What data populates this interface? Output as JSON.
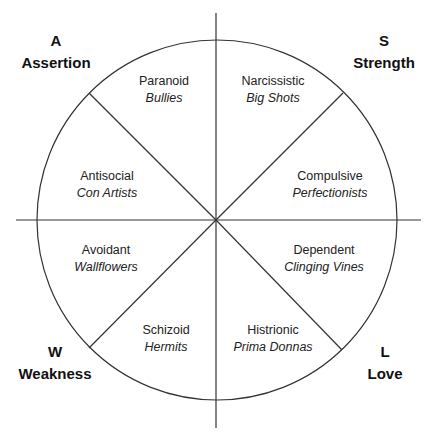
{
  "diagram": {
    "type": "circumplex-wheel",
    "line_color": "#333333",
    "center": [
      216,
      220
    ],
    "radius": 180,
    "corners": [
      {
        "id": "assertion",
        "letter": "A",
        "word": "Assertion",
        "x": 56,
        "y": 30
      },
      {
        "id": "strength",
        "letter": "S",
        "word": "Strength",
        "x": 384,
        "y": 30
      },
      {
        "id": "weakness",
        "letter": "W",
        "word": "Weakness",
        "x": 55,
        "y": 341
      },
      {
        "id": "love",
        "letter": "L",
        "word": "Love",
        "x": 385,
        "y": 341
      }
    ],
    "segments": [
      {
        "id": "paranoid",
        "disorder": "Paranoid",
        "nickname": "Bullies",
        "x": 164,
        "y": 73
      },
      {
        "id": "narcissistic",
        "disorder": "Narcissistic",
        "nickname": "Big Shots",
        "x": 273,
        "y": 73
      },
      {
        "id": "antisocial",
        "disorder": "Antisocial",
        "nickname": "Con Artists",
        "x": 107,
        "y": 168
      },
      {
        "id": "compulsive",
        "disorder": "Compulsive",
        "nickname": "Perfectionists",
        "x": 330,
        "y": 168
      },
      {
        "id": "avoidant",
        "disorder": "Avoidant",
        "nickname": "Wallflowers",
        "x": 106,
        "y": 242
      },
      {
        "id": "dependent",
        "disorder": "Dependent",
        "nickname": "Clinging Vines",
        "x": 324,
        "y": 242
      },
      {
        "id": "schizoid",
        "disorder": "Schizoid",
        "nickname": "Hermits",
        "x": 166,
        "y": 322
      },
      {
        "id": "histrionic",
        "disorder": "Histrionic",
        "nickname": "Prima Donnas",
        "x": 273,
        "y": 322
      }
    ]
  }
}
